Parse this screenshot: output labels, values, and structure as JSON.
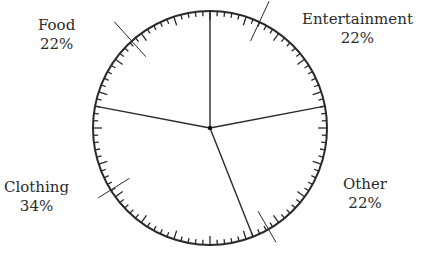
{
  "chart_data": {
    "type": "pie",
    "title": "",
    "categories": [
      "Entertainment",
      "Other",
      "Clothing",
      "Food"
    ],
    "values": [
      22,
      22,
      34,
      22
    ],
    "unit": "%",
    "start_angle_deg": 0,
    "direction": "clockwise",
    "ticks": {
      "count": 100,
      "major_every": 5
    },
    "labels": [
      {
        "name": "Food",
        "value": "22%"
      },
      {
        "name": "Entertainment",
        "value": "22%"
      },
      {
        "name": "Other",
        "value": "22%"
      },
      {
        "name": "Clothing",
        "value": "34%"
      }
    ]
  },
  "colors": {
    "line": "#2a2a2a",
    "background": "#ffffff"
  }
}
